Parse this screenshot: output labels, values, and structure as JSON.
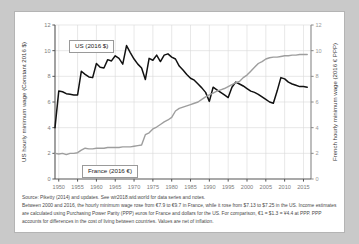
{
  "chart_data": {
    "type": "line",
    "title": "",
    "xlabel": "",
    "ylabel": "US hourly minimum wage (Constant 2016 $)",
    "ylabel_right": "French hourly minimum wage (2016 € PPP)",
    "xlim": [
      1949,
      2017
    ],
    "ylim": [
      0,
      12
    ],
    "ylim_right": [
      0,
      12
    ],
    "grid": true,
    "legend_position": "inline-annotations",
    "xticks": [
      "1950",
      "1955",
      "1960",
      "1965",
      "1970",
      "1975",
      "1980",
      "1985",
      "1990",
      "1995",
      "2000",
      "2005",
      "2010",
      "2015"
    ],
    "yticks": [
      "0",
      "2",
      "4",
      "6",
      "8",
      "10",
      "12"
    ],
    "yticks_right": [
      "0",
      "2",
      "4",
      "6",
      "8",
      "10",
      "12"
    ],
    "series": [
      {
        "name": "US (2016 $)",
        "color": "#111111",
        "x": [
          1949,
          1950,
          1951,
          1952,
          1953,
          1954,
          1955,
          1956,
          1957,
          1958,
          1959,
          1960,
          1961,
          1962,
          1963,
          1964,
          1965,
          1966,
          1967,
          1968,
          1969,
          1970,
          1971,
          1972,
          1973,
          1974,
          1975,
          1976,
          1977,
          1978,
          1979,
          1980,
          1981,
          1982,
          1983,
          1984,
          1985,
          1986,
          1987,
          1988,
          1989,
          1990,
          1991,
          1992,
          1993,
          1994,
          1995,
          1996,
          1997,
          1998,
          1999,
          2000,
          2001,
          2002,
          2003,
          2004,
          2005,
          2006,
          2007,
          2008,
          2009,
          2010,
          2011,
          2012,
          2013,
          2014,
          2015,
          2016
        ],
        "values": [
          4.0,
          6.85,
          6.8,
          6.65,
          6.6,
          6.55,
          6.55,
          8.4,
          8.15,
          7.95,
          7.9,
          9.0,
          8.7,
          8.65,
          9.3,
          9.2,
          9.6,
          9.4,
          8.95,
          10.4,
          9.85,
          9.35,
          8.95,
          8.65,
          7.75,
          9.4,
          9.25,
          9.65,
          9.15,
          9.65,
          9.75,
          9.5,
          9.35,
          8.8,
          8.5,
          8.15,
          7.85,
          7.7,
          7.4,
          7.1,
          6.75,
          6.05,
          7.15,
          6.95,
          6.75,
          6.55,
          6.35,
          7.15,
          7.55,
          7.4,
          7.25,
          7.05,
          6.85,
          6.75,
          6.6,
          6.4,
          6.2,
          6.0,
          5.9,
          6.85,
          7.9,
          7.8,
          7.55,
          7.4,
          7.3,
          7.2,
          7.2,
          7.15
        ]
      },
      {
        "name": "France (2016 €)",
        "color": "#9e9e9e",
        "x": [
          1949,
          1950,
          1951,
          1952,
          1953,
          1954,
          1955,
          1956,
          1957,
          1958,
          1959,
          1960,
          1961,
          1962,
          1963,
          1964,
          1965,
          1966,
          1967,
          1968,
          1969,
          1970,
          1971,
          1972,
          1973,
          1974,
          1975,
          1976,
          1977,
          1978,
          1979,
          1980,
          1981,
          1982,
          1983,
          1984,
          1985,
          1986,
          1987,
          1988,
          1989,
          1990,
          1991,
          1992,
          1993,
          1994,
          1995,
          1996,
          1997,
          1998,
          1999,
          2000,
          2001,
          2002,
          2003,
          2004,
          2005,
          2006,
          2007,
          2008,
          2009,
          2010,
          2011,
          2012,
          2013,
          2014,
          2015,
          2016
        ],
        "values": [
          2.0,
          1.95,
          2.0,
          1.9,
          2.0,
          2.0,
          2.05,
          2.25,
          2.4,
          2.35,
          2.35,
          2.4,
          2.4,
          2.4,
          2.45,
          2.45,
          2.45,
          2.45,
          2.5,
          2.5,
          2.5,
          2.55,
          2.6,
          2.65,
          3.45,
          3.6,
          3.9,
          4.05,
          4.25,
          4.45,
          4.6,
          4.8,
          5.3,
          5.5,
          5.6,
          5.7,
          5.8,
          5.9,
          6.0,
          6.2,
          6.4,
          6.55,
          6.7,
          6.85,
          6.95,
          7.05,
          7.2,
          7.35,
          7.5,
          7.6,
          7.9,
          8.1,
          8.4,
          8.7,
          9.0,
          9.15,
          9.35,
          9.45,
          9.5,
          9.5,
          9.55,
          9.6,
          9.6,
          9.65,
          9.65,
          9.7,
          9.7,
          9.7
        ]
      }
    ]
  },
  "legend": {
    "us": "US (2016 $)",
    "france": "France (2016 €)"
  },
  "footnotes": {
    "source": "Source: Piketty (2014) and updates. See wir2018.wid.world for data series and notes.",
    "note": "Between 2000 and 2016, the hourly minimum wage rose from €7.9 to €9.7 in France, while it rose from $7.13 to $7.25 in the US. Income estimates are calculated using Purchasing Power Parity (PPP) euros for France and dollars for the US. For comparison, €1 = $1.3 = ¥4.4 at PPP. PPP accounts for differences in the cost of living between countries. Values are net of inflation."
  }
}
